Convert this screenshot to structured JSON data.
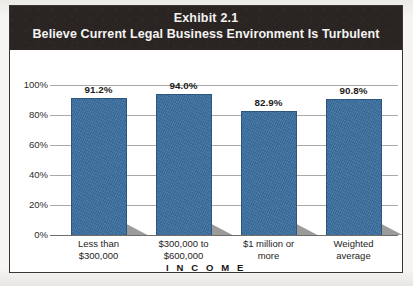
{
  "exhibit": {
    "title_line1": "Exhibit 2.1",
    "title_line2": "Believe Current Legal Business Environment Is Turbulent"
  },
  "colors": {
    "bar": "#3b6fa0",
    "bar_border": "#2d567f",
    "title_band": "#2a2523",
    "gridline": "#a9a9a7",
    "shadow": "#9b9b99"
  },
  "chart_data": {
    "type": "bar",
    "xlabel": "I N C O M E",
    "ylabel": "",
    "categories": [
      "Less than $300,000",
      "$300,000 to $600,000",
      "$1 million or more",
      "Weighted average"
    ],
    "category_lines": [
      [
        "Less than",
        "$300,000"
      ],
      [
        "$300,000 to",
        "$600,000"
      ],
      [
        "$1 million or",
        "more"
      ],
      [
        "Weighted",
        "average"
      ]
    ],
    "values": [
      91.2,
      94.0,
      82.9,
      90.8
    ],
    "data_labels": [
      "91.2%",
      "94.0%",
      "82.9%",
      "90.8%"
    ],
    "ylim": [
      0,
      100
    ],
    "yticks": [
      0,
      20,
      40,
      60,
      80,
      100
    ],
    "ytick_labels": [
      "0%",
      "20%",
      "40%",
      "60%",
      "80%",
      "100%"
    ],
    "grid": true,
    "legend": false
  }
}
